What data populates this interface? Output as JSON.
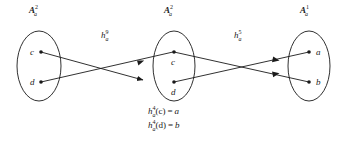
{
  "figure": {
    "width": 348,
    "height": 143,
    "background": "#ffffff",
    "stroke_color": "#1a1a1a",
    "text_color": "#1a1a1a"
  },
  "sets": [
    {
      "id": "left",
      "label_base": "A",
      "label_sup": "2",
      "label_sub": "a",
      "nodes": [
        {
          "name": "c",
          "label": "c",
          "label_side": "left"
        },
        {
          "name": "d",
          "label": "d",
          "label_side": "left"
        }
      ]
    },
    {
      "id": "middle",
      "label_base": "A",
      "label_sup": "2",
      "label_sub": "a",
      "nodes": [
        {
          "name": "c",
          "label": "c",
          "label_side": "below"
        },
        {
          "name": "d",
          "label": "d",
          "label_side": "below"
        }
      ]
    },
    {
      "id": "right",
      "label_base": "A",
      "label_sup": "1",
      "label_sub": "a",
      "nodes": [
        {
          "name": "a",
          "label": "a",
          "label_side": "right"
        },
        {
          "name": "b",
          "label": "b",
          "label_side": "right"
        }
      ]
    }
  ],
  "maps": [
    {
      "id": "left-map",
      "base": "h",
      "sup": "9",
      "sub": "a"
    },
    {
      "id": "right-map",
      "base": "h",
      "sup": "5",
      "sub": "a"
    }
  ],
  "arrows": [
    {
      "from": "left.c",
      "to": "middle.d"
    },
    {
      "from": "left.d",
      "to": "middle.c"
    },
    {
      "from": "middle.c",
      "to": "right.b"
    },
    {
      "from": "middle.d",
      "to": "right.a"
    }
  ],
  "formulas": [
    {
      "base": "h",
      "sup": "4",
      "sub": "a",
      "arg": "(c)",
      "eq": "=",
      "result": "a"
    },
    {
      "base": "h",
      "sup": "4",
      "sub": "a",
      "arg": "(d)",
      "eq": "=",
      "result": "b"
    }
  ]
}
